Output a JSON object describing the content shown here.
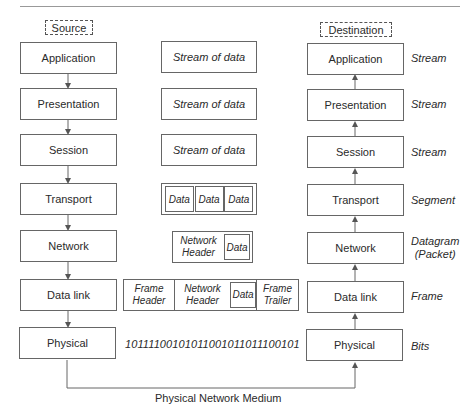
{
  "source_label": "Source",
  "destination_label": "Destination",
  "source_stack": [
    "Application",
    "Presentation",
    "Session",
    "Transport",
    "Network",
    "Data link",
    "Physical"
  ],
  "destination_stack": [
    "Application",
    "Presentation",
    "Session",
    "Transport",
    "Network",
    "Data link",
    "Physical"
  ],
  "pdu_names": [
    "Stream",
    "Stream",
    "Stream",
    "Segment",
    "Datagram (Packet)",
    "Frame",
    "Bits"
  ],
  "pdu_datagram_line1": "Datagram",
  "pdu_datagram_line2": "(Packet)",
  "units": {
    "stream": "Stream of data",
    "segment_cells": [
      "Data",
      "Data",
      "Data"
    ],
    "packet": {
      "header": "Network Header",
      "data": "Data"
    },
    "frame": {
      "header": "Frame Header",
      "network_header": "Network Header",
      "data": "Data",
      "trailer": "Frame Trailer"
    },
    "bits": "10111100101011001011011100101"
  },
  "medium_label": "Physical Network Medium",
  "colors": {
    "line": "#666666",
    "text": "#2a2a2a",
    "background": "#ffffff"
  }
}
